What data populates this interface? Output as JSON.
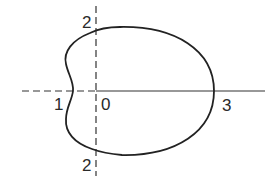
{
  "figure": {
    "curve": {
      "equation": "r = 2 + cos θ",
      "stroke": "#222222"
    },
    "axes": {
      "color": "#333333"
    },
    "labels": {
      "y_top": "2",
      "y_bottom": "2",
      "x_left": "1",
      "origin": "0",
      "x_right": "3"
    }
  }
}
